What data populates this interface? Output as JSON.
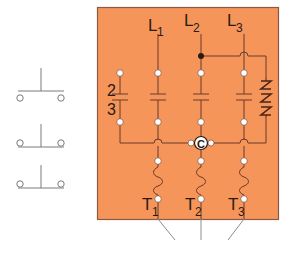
{
  "diagram": {
    "type": "three-phase magnetic contactor wiring diagram",
    "colors": {
      "panel_fill": "#F5955A",
      "panel_border": "#8A5A44",
      "wire": "#6B3A2A",
      "terminal_fill": "#FFFFFF",
      "junction_dot": "#2A1A14",
      "switch_line": "#7A7A7A",
      "lead_line": "#8C8C8C"
    },
    "line_labels": {
      "l1": {
        "main": "L",
        "sub": "1"
      },
      "l2": {
        "main": "L",
        "sub": "2"
      },
      "l3": {
        "main": "L",
        "sub": "3"
      }
    },
    "load_labels": {
      "t1": {
        "main": "T",
        "sub": "1"
      },
      "t2": {
        "main": "T",
        "sub": "2"
      },
      "t3": {
        "main": "T",
        "sub": "3"
      }
    },
    "aux_contact_labels": {
      "top": "2",
      "bottom": "3"
    },
    "common_node_label": "C",
    "coil_symbol": "NNN",
    "external_switches": [
      {
        "name": "normally-open-pushbutton",
        "position": "top"
      },
      {
        "name": "normally-closed-pushbutton",
        "position": "middle"
      },
      {
        "name": "normally-closed-pushbutton",
        "position": "bottom"
      }
    ]
  }
}
